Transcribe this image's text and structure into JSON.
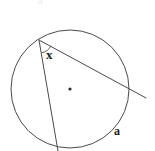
{
  "figure": {
    "kind": "circle-geometry-diagram",
    "background_color": "#ffffff",
    "stroke_color": "#4a4a4a",
    "label_color": "#1a1a1a",
    "labels": {
      "angle_label": "x",
      "arc_label": "a",
      "top_artifact": "a"
    },
    "circle": {
      "center_x": 70,
      "center_y": 89,
      "radius": 59,
      "center_dot_radius": 1.6
    },
    "angle_arc": {
      "radius": 13,
      "description": "small arc marking inscribed angle x at apex vertex"
    },
    "points": {
      "apex": {
        "x": 39,
        "y": 40
      },
      "chord_bottom": {
        "x": 57,
        "y": 147
      },
      "chord_tail": {
        "x": 58,
        "y": 151
      },
      "secant_exit": {
        "x": 128,
        "y": 88
      },
      "secant_tail": {
        "x": 146,
        "y": 98
      }
    },
    "segments": [
      {
        "name": "chord-apex-to-bottom",
        "x1": 39,
        "y1": 40,
        "x2": 58,
        "y2": 151
      },
      {
        "name": "secant-apex-through-circle",
        "x1": 39,
        "y1": 40,
        "x2": 146,
        "y2": 98
      }
    ]
  }
}
